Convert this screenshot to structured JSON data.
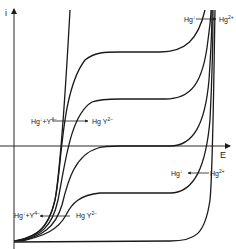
{
  "figure": {
    "type": "current-potential curves (polarogram)",
    "axes": {
      "y_label": "i",
      "x_label": "E"
    },
    "annotations": [
      {
        "id": "upper-left",
        "left": "Hg",
        "left_sup": "↓",
        "middle": "+Y",
        "middle_sup": "4−",
        "right": "Hg Y",
        "right_sup": "2−"
      },
      {
        "id": "lower-left",
        "left": "Hg",
        "left_sup": "↓",
        "middle": "+Y",
        "middle_sup": "4−",
        "right": "Hg Y",
        "right_sup": "2−"
      },
      {
        "id": "upper-right",
        "left": "Hg",
        "left_sup": "↓",
        "right": "Hg",
        "right_sup": "2+"
      },
      {
        "id": "lower-right",
        "left": "Hg",
        "left_sup": "↓",
        "right": "Hg",
        "right_sup": "2+"
      }
    ],
    "plateau_levels_px": [
      52,
      99,
      146,
      193,
      241
    ],
    "colors": {
      "line": "#1a1a1a",
      "background": "#ffffff"
    }
  }
}
